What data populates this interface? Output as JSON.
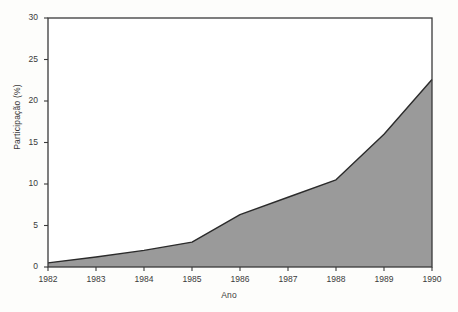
{
  "chart_data": {
    "type": "area",
    "title": "",
    "xlabel": "Ano",
    "ylabel": "Participação (%)",
    "categories": [
      "1982",
      "1983",
      "1984",
      "1985",
      "1986",
      "1987",
      "1988",
      "1989",
      "1990"
    ],
    "x": [
      1982,
      1983,
      1984,
      1985,
      1986,
      1987,
      1988,
      1989,
      1990
    ],
    "values": [
      0.5,
      1.2,
      2.0,
      3.0,
      6.3,
      8.4,
      10.5,
      16.0,
      22.6
    ],
    "series": [
      {
        "name": "Participação",
        "values": [
          0.5,
          1.2,
          2.0,
          3.0,
          6.3,
          8.4,
          10.5,
          16.0,
          22.6
        ]
      }
    ],
    "xlim": [
      1982,
      1990
    ],
    "ylim": [
      0,
      30
    ],
    "yticks": [
      0,
      5,
      10,
      15,
      20,
      25,
      30
    ],
    "ytick_labels": [
      "0",
      "5",
      "10",
      "15",
      "20",
      "25",
      "30"
    ],
    "xticks": [
      1982,
      1983,
      1984,
      1985,
      1986,
      1987,
      1988,
      1989,
      1990
    ],
    "xtick_labels": [
      "1982",
      "1983",
      "1984",
      "1985",
      "1986",
      "1987",
      "1988",
      "1989",
      "1990"
    ],
    "grid": false,
    "legend": false,
    "legend_position": "none",
    "fill_color": "#9a9a9a",
    "line_color": "#2b2b2b",
    "axis_color": "#3a3a3a",
    "background_color": "#fdfdfb",
    "plot_background_color": "#ffffff"
  }
}
